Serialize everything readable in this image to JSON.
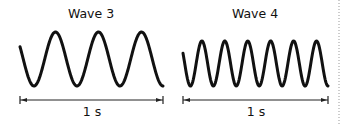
{
  "panels": [
    {
      "title": "Wave 3",
      "cycles": 3.5,
      "duration_label": "1 s",
      "x_start": 20,
      "x_end": 163,
      "y_top": 32,
      "y_bottom": 86,
      "phase_start": "mid-descending"
    },
    {
      "title": "Wave 4",
      "cycles": 6.5,
      "duration_label": "1 s",
      "x_start": 183,
      "x_end": 328,
      "y_top": 41,
      "y_bottom": 86,
      "phase_start": "mid-descending"
    }
  ],
  "colors": {
    "stroke": "#111111",
    "divider": "#999999"
  }
}
